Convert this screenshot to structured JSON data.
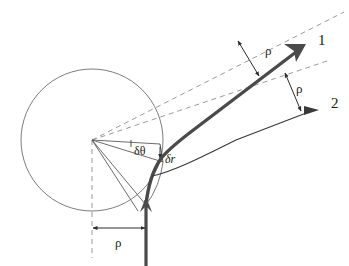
{
  "figure": {
    "background_color": "#ffffff",
    "stroke_color": "#3a3a3a",
    "thick_stroke_color": "#4a4a4a",
    "dashed_color": "#8a8a8a",
    "label_color": "#1a1a1a"
  },
  "labels": {
    "ray_one": "1",
    "ray_two": "2",
    "rho_upper": "ρ",
    "rho_lower": "ρ",
    "rho_bottom": "ρ",
    "delta_theta": "δθ",
    "delta_r": "δr"
  },
  "elements": {
    "circle_name": "body-circle",
    "incoming_ray_name": "incoming-ray",
    "outgoing_ray_one_name": "outgoing-ray-1",
    "outgoing_ray_two_name": "outgoing-ray-2",
    "center_name": "circle-center-vertex"
  },
  "geometry": {
    "circle": {
      "cx": 92,
      "cy": 140,
      "r": 71
    },
    "vertex": {
      "x": 92,
      "y": 140
    },
    "ray1_tip": {
      "x": 306,
      "y": 44
    },
    "ray2_tip": {
      "x": 319,
      "y": 110
    },
    "incoming_ray_x": 146
  }
}
